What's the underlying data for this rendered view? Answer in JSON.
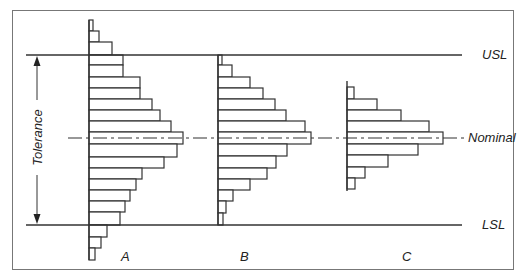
{
  "labels": {
    "usl": "USL",
    "lsl": "LSL",
    "nominal": "Nominal",
    "tolerance": "Tolerance",
    "hist_a": "A",
    "hist_b": "B",
    "hist_c": "C"
  },
  "colors": {
    "line": "#333333",
    "frame": "#777777",
    "background": "#ffffff"
  },
  "geometry": {
    "usl_y": 55,
    "lsl_y": 225,
    "nominal_y": 138
  },
  "histograms": [
    {
      "id": "A",
      "baseline_x": 89,
      "bars": [
        {
          "y0": 20,
          "y1": 31,
          "x1": 93
        },
        {
          "y0": 31,
          "y1": 42,
          "x1": 99
        },
        {
          "y0": 42,
          "y1": 55,
          "x1": 112
        },
        {
          "y0": 55,
          "y1": 65,
          "x1": 123
        },
        {
          "y0": 65,
          "y1": 77,
          "x1": 123
        },
        {
          "y0": 77,
          "y1": 88,
          "x1": 140
        },
        {
          "y0": 88,
          "y1": 99,
          "x1": 140
        },
        {
          "y0": 99,
          "y1": 110,
          "x1": 152
        },
        {
          "y0": 110,
          "y1": 121,
          "x1": 160
        },
        {
          "y0": 121,
          "y1": 132,
          "x1": 171
        },
        {
          "y0": 132,
          "y1": 144,
          "x1": 183
        },
        {
          "y0": 144,
          "y1": 157,
          "x1": 177
        },
        {
          "y0": 157,
          "y1": 168,
          "x1": 164
        },
        {
          "y0": 168,
          "y1": 179,
          "x1": 142
        },
        {
          "y0": 179,
          "y1": 190,
          "x1": 136
        },
        {
          "y0": 190,
          "y1": 201,
          "x1": 130
        },
        {
          "y0": 201,
          "y1": 212,
          "x1": 125
        },
        {
          "y0": 212,
          "y1": 225,
          "x1": 120
        },
        {
          "y0": 225,
          "y1": 237,
          "x1": 107
        },
        {
          "y0": 237,
          "y1": 248,
          "x1": 101
        },
        {
          "y0": 248,
          "y1": 260,
          "x1": 95
        }
      ]
    },
    {
      "id": "B",
      "baseline_x": 218,
      "bars": [
        {
          "y0": 55,
          "y1": 65,
          "x1": 222
        },
        {
          "y0": 65,
          "y1": 77,
          "x1": 232
        },
        {
          "y0": 77,
          "y1": 88,
          "x1": 250
        },
        {
          "y0": 88,
          "y1": 99,
          "x1": 263
        },
        {
          "y0": 99,
          "y1": 110,
          "x1": 275
        },
        {
          "y0": 110,
          "y1": 121,
          "x1": 286
        },
        {
          "y0": 121,
          "y1": 132,
          "x1": 305
        },
        {
          "y0": 132,
          "y1": 144,
          "x1": 311
        },
        {
          "y0": 144,
          "y1": 156,
          "x1": 287
        },
        {
          "y0": 156,
          "y1": 168,
          "x1": 276
        },
        {
          "y0": 168,
          "y1": 179,
          "x1": 267
        },
        {
          "y0": 179,
          "y1": 190,
          "x1": 250
        },
        {
          "y0": 190,
          "y1": 201,
          "x1": 233
        },
        {
          "y0": 201,
          "y1": 213,
          "x1": 226
        },
        {
          "y0": 213,
          "y1": 225,
          "x1": 223
        }
      ]
    },
    {
      "id": "C",
      "baseline_x": 347,
      "axis_y0": 81,
      "axis_y1": 191,
      "bars": [
        {
          "y0": 87,
          "y1": 99,
          "x1": 354
        },
        {
          "y0": 99,
          "y1": 110,
          "x1": 377
        },
        {
          "y0": 110,
          "y1": 121,
          "x1": 401
        },
        {
          "y0": 121,
          "y1": 132,
          "x1": 429
        },
        {
          "y0": 132,
          "y1": 144,
          "x1": 443
        },
        {
          "y0": 144,
          "y1": 155,
          "x1": 418
        },
        {
          "y0": 155,
          "y1": 167,
          "x1": 388
        },
        {
          "y0": 167,
          "y1": 178,
          "x1": 365
        },
        {
          "y0": 178,
          "y1": 189,
          "x1": 355
        }
      ]
    }
  ]
}
